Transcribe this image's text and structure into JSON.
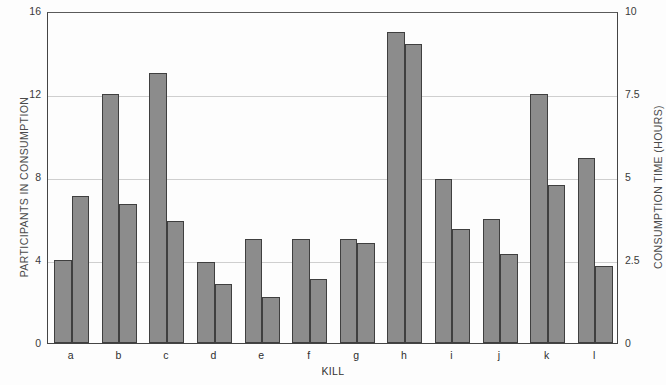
{
  "chart_data": {
    "type": "bar",
    "title": "",
    "xlabel": "KILL",
    "ylabel": "PARTICIPANTS IN CONSUMPTION",
    "y2label": "CONSUMPTION TIME (HOURS)",
    "categories": [
      "a",
      "b",
      "c",
      "d",
      "e",
      "f",
      "g",
      "h",
      "i",
      "j",
      "k",
      "l"
    ],
    "ylim": [
      0,
      16
    ],
    "y2lim": [
      0,
      10
    ],
    "yticks": [
      "0",
      "4",
      "8",
      "12",
      "16"
    ],
    "ytick_values": [
      0,
      4,
      8,
      12,
      16
    ],
    "y2ticks": [
      "0",
      "2.5",
      "5",
      "7.5",
      "10"
    ],
    "y2tick_values": [
      0,
      2.5,
      5,
      7.5,
      10
    ],
    "grid": true,
    "legend": "none",
    "bar_color": "#8c8c8c",
    "bar_edge_color": "#3f3f3f",
    "series": [
      {
        "name": "Participants in consumption",
        "axis": "left",
        "values": [
          4.0,
          12.0,
          13.0,
          3.9,
          5.0,
          5.0,
          5.0,
          15.0,
          7.9,
          6.0,
          12.0,
          8.9
        ]
      },
      {
        "name": "Consumption time (hours)",
        "axis": "right",
        "values": [
          7.1,
          6.7,
          5.9,
          2.85,
          2.2,
          3.1,
          4.8,
          14.4,
          5.5,
          4.3,
          7.6,
          3.7
        ]
      }
    ]
  }
}
